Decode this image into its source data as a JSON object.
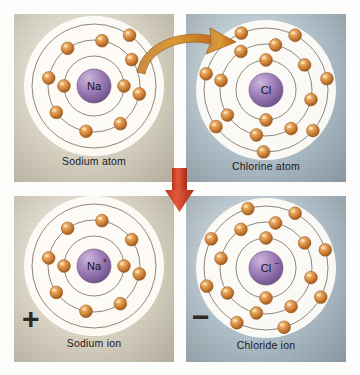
{
  "figure": {
    "colors": {
      "electron": "#d98a3d",
      "electron_highlight": "#f3c98a",
      "nucleus": "#9b7ab5",
      "nucleus_highlight": "#cdb6dd",
      "shell_line": "#6b6257",
      "curved_arrow": "#d2781f",
      "down_arrow": "#d4412a",
      "panel_warm": "#dcd6c7",
      "panel_cool": "#b4c3cd",
      "caption_text": "#1a1a1a",
      "charge_glyph": "#2b2a25"
    },
    "panels": [
      {
        "id": "sodium-atom",
        "caption": "Sodium atom",
        "nucleus_label": "Na",
        "nucleus_symbol": "Na",
        "nucleus_charge": "",
        "background": "warm",
        "charge_glyph": "",
        "shells": [
          {
            "name": "K",
            "radius": 30,
            "electrons": 2,
            "start_angle": 0
          },
          {
            "name": "L",
            "radius": 46,
            "electrons": 8,
            "start_angle": 10
          },
          {
            "name": "M",
            "radius": 62,
            "electrons": 1,
            "start_angle": -55
          }
        ],
        "electron_counts": [
          2,
          8,
          1
        ],
        "total_electrons": 11
      },
      {
        "id": "chlorine-atom",
        "caption": "Chlorine atom",
        "nucleus_label": "Cl",
        "nucleus_symbol": "Cl",
        "nucleus_charge": "",
        "background": "cool",
        "charge_glyph": "",
        "shells": [
          {
            "name": "K",
            "radius": 30,
            "electrons": 2,
            "start_angle": 90
          },
          {
            "name": "L",
            "radius": 46,
            "electrons": 8,
            "start_angle": 12
          },
          {
            "name": "M",
            "radius": 62,
            "electrons": 7,
            "start_angle": -62
          }
        ],
        "electron_counts": [
          2,
          8,
          7
        ],
        "total_electrons": 17
      },
      {
        "id": "sodium-ion",
        "caption": "Sodium ion",
        "nucleus_label": "Na+",
        "nucleus_symbol": "Na",
        "nucleus_charge": "+",
        "background": "warm",
        "charge_glyph": "+",
        "shells": [
          {
            "name": "K",
            "radius": 30,
            "electrons": 2,
            "start_angle": 0
          },
          {
            "name": "L",
            "radius": 46,
            "electrons": 8,
            "start_angle": 10
          },
          {
            "name": "M",
            "radius": 62,
            "electrons": 0,
            "start_angle": 0
          }
        ],
        "electron_counts": [
          2,
          8,
          0
        ],
        "total_electrons": 10
      },
      {
        "id": "chloride-ion",
        "caption": "Chloride ion",
        "nucleus_label": "Cl-",
        "nucleus_symbol": "Cl",
        "nucleus_charge": "−",
        "background": "cool",
        "charge_glyph": "−",
        "shells": [
          {
            "name": "K",
            "radius": 30,
            "electrons": 2,
            "start_angle": 90
          },
          {
            "name": "L",
            "radius": 46,
            "electrons": 8,
            "start_angle": 12
          },
          {
            "name": "M",
            "radius": 62,
            "electrons": 8,
            "start_angle": -62
          }
        ],
        "electron_counts": [
          2,
          8,
          8
        ],
        "total_electrons": 18
      }
    ],
    "arrows": [
      {
        "id": "electron-transfer-arrow",
        "shape": "curved",
        "direction": "left-to-right",
        "color": "#d2781f",
        "meaning": "electron transferred from sodium to chlorine"
      },
      {
        "id": "reaction-arrow",
        "shape": "straight",
        "direction": "downward",
        "color": "#d4412a",
        "meaning": "reaction proceeds to ions"
      }
    ]
  }
}
